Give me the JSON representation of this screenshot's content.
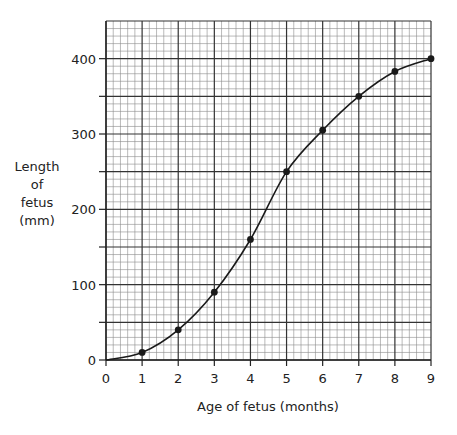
{
  "chart_data": {
    "type": "line",
    "title": "",
    "xlabel": "Age of fetus (months)",
    "ylabel": "Length of fetus (mm)",
    "ylabel_lines": [
      "Length",
      "of",
      "fetus",
      "(mm)"
    ],
    "x": [
      0,
      1,
      2,
      3,
      4,
      5,
      6,
      7,
      8,
      9
    ],
    "series": [
      {
        "name": "Length of fetus",
        "values": [
          0,
          10,
          40,
          90,
          160,
          250,
          305,
          350,
          383,
          400
        ],
        "markers_from_index": 1
      }
    ],
    "xlim": [
      0,
      9
    ],
    "ylim": [
      0,
      450
    ],
    "x_ticks": [
      0,
      1,
      2,
      3,
      4,
      5,
      6,
      7,
      8,
      9
    ],
    "y_ticks": [
      0,
      100,
      200,
      300,
      400
    ],
    "y_tick_minor_marks": [
      50,
      150,
      250,
      350
    ],
    "grid": {
      "on": true,
      "major_x_step": 1,
      "major_y_step": 50,
      "minor_subdivisions": 5
    },
    "legend": null,
    "colors": {
      "line": "#1a1a1a",
      "grid_major": "#333333",
      "grid_minor": "#8c8c8c"
    }
  }
}
